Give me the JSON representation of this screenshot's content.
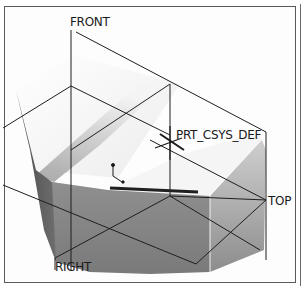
{
  "viewport": {
    "datum_planes": [
      {
        "id": "front",
        "label": "FRONT"
      },
      {
        "id": "top",
        "label": "TOP"
      },
      {
        "id": "right",
        "label": "RIGHT"
      }
    ],
    "csys": {
      "label": "PRT_CSYS_DEF"
    }
  },
  "colors": {
    "datum_line": "#1e1e1e",
    "face_light": "#f2f2f2",
    "face_mid": "#bdbdbd",
    "face_dark": "#8a8a8a",
    "frame": "#5a5a5a"
  }
}
